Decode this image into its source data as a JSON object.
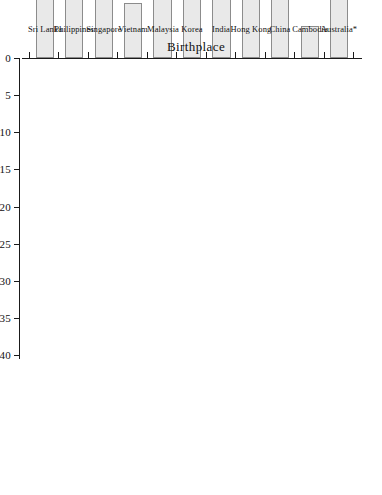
{
  "chart_data": {
    "type": "bar",
    "orientation": "vertical-bars-rotated",
    "title": "",
    "subtitle": "",
    "xlabel": "Birthplace",
    "ylabel": "%",
    "categories": [
      "Australia*",
      "Cambodia",
      "China",
      "Hong Kong",
      "India",
      "Korea",
      "Malaysia",
      "Vietnam",
      "Singapore",
      "Philippines",
      "Sri Lanka"
    ],
    "values": [
      12.2,
      4.3,
      20.2,
      27.6,
      35.0,
      14.8,
      37.7,
      7.4,
      27.7,
      30.2,
      32.7
    ],
    "series": [
      {
        "name": "%",
        "values": [
          12.2,
          4.3,
          20.2,
          27.6,
          35.0,
          14.8,
          37.7,
          7.4,
          27.7,
          30.2,
          32.7
        ]
      }
    ],
    "ylim": [
      0,
      40
    ],
    "ytick_labels": [
      "0",
      "5",
      "10",
      "15",
      "20",
      "25",
      "30",
      "35",
      "40"
    ],
    "ytick_values": [
      0,
      5,
      10,
      15,
      20,
      25,
      30,
      35,
      40
    ],
    "grid": false,
    "legend": false,
    "legend_position": "none",
    "bar_fill_color": "#e9e9e9",
    "bar_border_color": "#8c8c8c",
    "axis_color": "#1a1a1a",
    "background_color": "#ffffff",
    "annotations": []
  },
  "axes": {
    "value_axis_title": "%",
    "category_axis_title": "Birthplace"
  }
}
